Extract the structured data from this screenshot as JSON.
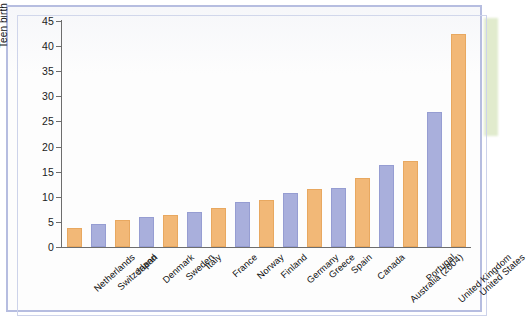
{
  "figure": {
    "frame_border_color": "#b6bde0",
    "background_color": "#fdfdfd",
    "marker_strip_color": "#c9dca6"
  },
  "chart_data": {
    "type": "bar",
    "title": "",
    "xlabel": "",
    "ylabel": "Teen birth rate (per 1,000 girls 15–19)",
    "ylim": [
      0,
      45
    ],
    "ytick_step": 5,
    "yticks": [
      "45",
      "40",
      "35",
      "30",
      "25",
      "20",
      "15",
      "10",
      "5",
      "0"
    ],
    "grid": false,
    "legend": "none",
    "bar_colors": {
      "orange": "#f2b877",
      "blue": "#a9afdc"
    },
    "categories": [
      "Netherlands",
      "Switzerland",
      "Japan",
      "Denmark",
      "Sweden",
      "Italy",
      "France",
      "Norway",
      "Finland",
      "Germany",
      "Greece",
      "Spain",
      "Canada",
      "Australia (2004)",
      "Portugal",
      "United Kingdom",
      "United States"
    ],
    "values": [
      3.8,
      4.5,
      5.3,
      6.0,
      6.4,
      7.0,
      7.8,
      9.0,
      9.4,
      10.7,
      11.5,
      11.7,
      13.8,
      16.3,
      17.2,
      26.8,
      42.5
    ],
    "series_colors": [
      "orange",
      "blue",
      "orange",
      "blue",
      "orange",
      "blue",
      "orange",
      "blue",
      "orange",
      "blue",
      "orange",
      "blue",
      "orange",
      "blue",
      "orange",
      "blue",
      "orange"
    ]
  }
}
